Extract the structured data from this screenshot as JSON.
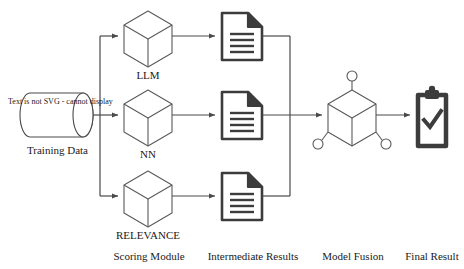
{
  "diagram": {
    "source": {
      "icon": "database-cylinder-icon",
      "inner_text": "Text is not SVG - cannot display",
      "label": "Training Data"
    },
    "scoring_modules": [
      {
        "icon": "cube-icon",
        "label": "LLM"
      },
      {
        "icon": "cube-icon",
        "label": "NN"
      },
      {
        "icon": "cube-icon",
        "label": "RELEVANCE"
      }
    ],
    "intermediate_results": [
      {
        "icon": "document-icon"
      },
      {
        "icon": "document-icon"
      },
      {
        "icon": "document-icon"
      }
    ],
    "fusion": {
      "icon": "cube-nodes-icon"
    },
    "final": {
      "icon": "clipboard-check-icon"
    },
    "stage_labels": [
      "Scoring Module",
      "Intermediate Results",
      "Model Fusion",
      "Final Result"
    ],
    "colors": {
      "stroke_line": "#4a4a4a",
      "stroke_cube": "#5a5a5a",
      "icon_dark": "#3c3c3c",
      "text": "#1a1a1a",
      "background": "#ffffff"
    }
  }
}
